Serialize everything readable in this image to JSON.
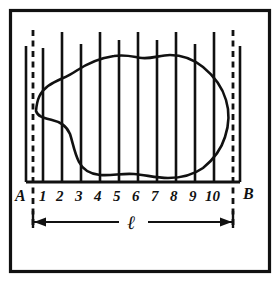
{
  "figure": {
    "kind": "line-diagram",
    "background_color": "#ffffff",
    "ink_color": "#111111",
    "border": {
      "name": "figure-border",
      "x": 10,
      "y": 10,
      "width": 259,
      "height": 262
    },
    "baseline": {
      "label": "baseline-AB",
      "y": 182,
      "x_start": 26,
      "x_end": 240
    },
    "end_markers": {
      "left_label": "A",
      "right_label": "B",
      "left_x": 18,
      "right_x": 248,
      "label_y": 200
    },
    "boundaries": {
      "style": "dashed",
      "left_x": 33,
      "right_x": 233,
      "y_top": 30,
      "y_bottom": 228
    },
    "ordinates": {
      "count": 10,
      "labels": [
        "1",
        "2",
        "3",
        "4",
        "5",
        "6",
        "7",
        "8",
        "9",
        "10"
      ],
      "x_positions": [
        43,
        62,
        81,
        100,
        119,
        138,
        157,
        176,
        195,
        214
      ],
      "top_y": [
        48,
        32,
        44,
        32,
        40,
        32,
        40,
        32,
        44,
        32
      ],
      "bottom_y": 182,
      "label_y": 200
    },
    "extra_verticals": {
      "left_x": 26,
      "right_x": 240,
      "top_y": 46,
      "bottom_y": 182
    },
    "dimension": {
      "label": "l",
      "label_symbol": "ℓ",
      "y": 221,
      "x_start": 33,
      "x_end": 233,
      "tick_top": 210,
      "tick_bottom": 228,
      "arrow_direction": "outward-both-ends"
    },
    "contour": {
      "name": "irregular-area-outline",
      "closed": true,
      "path": "M 36,111 C 37,99 40,92 48,86 C 58,79 66,78 76,71 C 88,63 100,58 114,56 C 126,54 134,57 142,58 C 152,59 160,55 170,55 C 182,55 193,59 203,67 C 214,76 222,86 226,100 C 230,113 229,125 225,137 C 221,150 213,160 203,168 C 193,175 181,178 168,178 C 156,178 146,175 134,174 C 122,173 112,176 100,175 C 90,174 83,170 79,162 C 74,152 73,143 70,134 C 66,125 60,122 52,120 C 44,118 38,117 36,111 Z"
    }
  }
}
